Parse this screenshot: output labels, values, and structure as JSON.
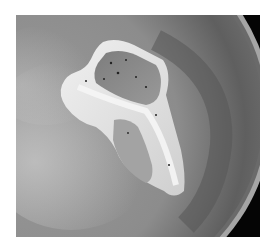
{
  "image": {
    "subject": "Chop searing in a pan with steam",
    "alt": "A bone-in chop searing in a pan with steam rising",
    "palette": {
      "background": "#ffffff",
      "pan_surface": "#8a8a8a",
      "pan_dark_ring": "#5a5a5a",
      "pan_rim": "#a8a8a8",
      "outside_pan": "#050505",
      "meat": "#8f8f8f",
      "fat_bone": "#e6e6e6",
      "steam": "#bdbdbd"
    }
  }
}
